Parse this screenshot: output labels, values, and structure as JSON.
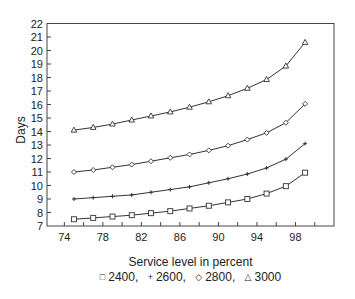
{
  "chart_data": {
    "type": "line",
    "title": "",
    "xlabel": "Service level in percent",
    "ylabel": "Days",
    "xlim": [
      72.2,
      102
    ],
    "ylim": [
      7,
      22
    ],
    "x_ticks": [
      74,
      76,
      78,
      80,
      82,
      84,
      86,
      88,
      90,
      92,
      94,
      96,
      98,
      100
    ],
    "x_tick_labels": [
      74,
      78,
      82,
      86,
      90,
      94,
      98
    ],
    "y_ticks": [
      7,
      8,
      9,
      10,
      11,
      12,
      13,
      14,
      15,
      16,
      17,
      18,
      19,
      20,
      21,
      22
    ],
    "grid": false,
    "legend_position": "bottom",
    "x": [
      75,
      77,
      79,
      81,
      83,
      85,
      87,
      89,
      91,
      93,
      95,
      97,
      99
    ],
    "series": [
      {
        "name": "2400",
        "marker": "square",
        "values": [
          7.5,
          7.6,
          7.7,
          7.8,
          7.95,
          8.1,
          8.3,
          8.5,
          8.75,
          9.0,
          9.4,
          9.95,
          10.95
        ]
      },
      {
        "name": "2600",
        "marker": "plus",
        "values": [
          9.0,
          9.1,
          9.2,
          9.3,
          9.5,
          9.7,
          9.9,
          10.2,
          10.5,
          10.85,
          11.3,
          11.95,
          13.1
        ]
      },
      {
        "name": "2800",
        "marker": "diamond",
        "values": [
          11.0,
          11.15,
          11.35,
          11.55,
          11.8,
          12.05,
          12.3,
          12.6,
          12.95,
          13.4,
          13.9,
          14.65,
          16.05
        ]
      },
      {
        "name": "3000",
        "marker": "triangle",
        "values": [
          14.1,
          14.3,
          14.55,
          14.85,
          15.15,
          15.45,
          15.8,
          16.2,
          16.65,
          17.2,
          17.85,
          18.85,
          20.6
        ]
      }
    ]
  },
  "legend": {
    "items": [
      {
        "symbol": "□",
        "label": "2400,"
      },
      {
        "symbol": "+",
        "label": "2600,"
      },
      {
        "symbol": "◇",
        "label": "2800,"
      },
      {
        "symbol": "△",
        "label": "3000"
      }
    ]
  }
}
